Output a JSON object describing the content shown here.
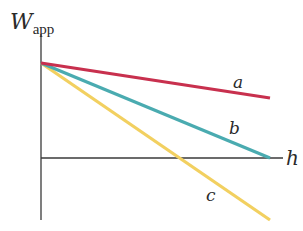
{
  "diagram": {
    "y_axis": {
      "label": "W",
      "subscript": "app"
    },
    "x_axis": {
      "label": "h"
    },
    "lines": [
      {
        "id": "a",
        "label": "a",
        "color": "#c8304e",
        "description": "shallowest negative slope"
      },
      {
        "id": "b",
        "label": "b",
        "color": "#4aabb0",
        "description": "reaches zero at end of h axis"
      },
      {
        "id": "c",
        "label": "c",
        "color": "#f2d060",
        "description": "steepest negative slope, crosses h axis and goes negative"
      }
    ],
    "colors": {
      "axis": "#3a3a3a",
      "text": "#2a2a2a"
    }
  }
}
